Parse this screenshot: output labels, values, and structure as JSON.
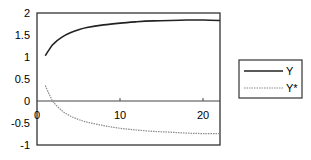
{
  "chart_data": {
    "type": "line",
    "title": "",
    "xlabel": "",
    "ylabel": "",
    "xlim": [
      0,
      22
    ],
    "ylim": [
      -1,
      2
    ],
    "x_ticks": [
      0,
      10,
      20
    ],
    "y_ticks": [
      2,
      1.5,
      1,
      0.5,
      0,
      -0.5,
      -1
    ],
    "x_tick_labels": [
      "0",
      "10",
      "20"
    ],
    "y_tick_labels": [
      "2",
      "1.5",
      "1",
      "0.5",
      "0",
      "-0.5",
      "-1"
    ],
    "grid": false,
    "legend_position": "right",
    "x": [
      1,
      1.5,
      2,
      3,
      4,
      5,
      6,
      8,
      10,
      12,
      14,
      16,
      18,
      20,
      22
    ],
    "series": [
      {
        "name": "Y",
        "color": "#222222",
        "style": "solid",
        "values": [
          1.03,
          1.18,
          1.3,
          1.45,
          1.55,
          1.62,
          1.67,
          1.73,
          1.77,
          1.8,
          1.82,
          1.83,
          1.84,
          1.84,
          1.83
        ]
      },
      {
        "name": "Y*",
        "color": "#888888",
        "style": "dotted",
        "values": [
          0.35,
          0.14,
          -0.03,
          -0.22,
          -0.34,
          -0.42,
          -0.48,
          -0.56,
          -0.62,
          -0.66,
          -0.69,
          -0.71,
          -0.73,
          -0.74,
          -0.74
        ]
      }
    ]
  },
  "legend": {
    "items": [
      {
        "label": "Y"
      },
      {
        "label": "Y*"
      }
    ]
  },
  "axes": {
    "x_labels": [
      "0",
      "10",
      "20"
    ],
    "y_labels": [
      "2",
      "1.5",
      "1",
      "0.5",
      "0",
      "-0.5",
      "-1"
    ]
  }
}
